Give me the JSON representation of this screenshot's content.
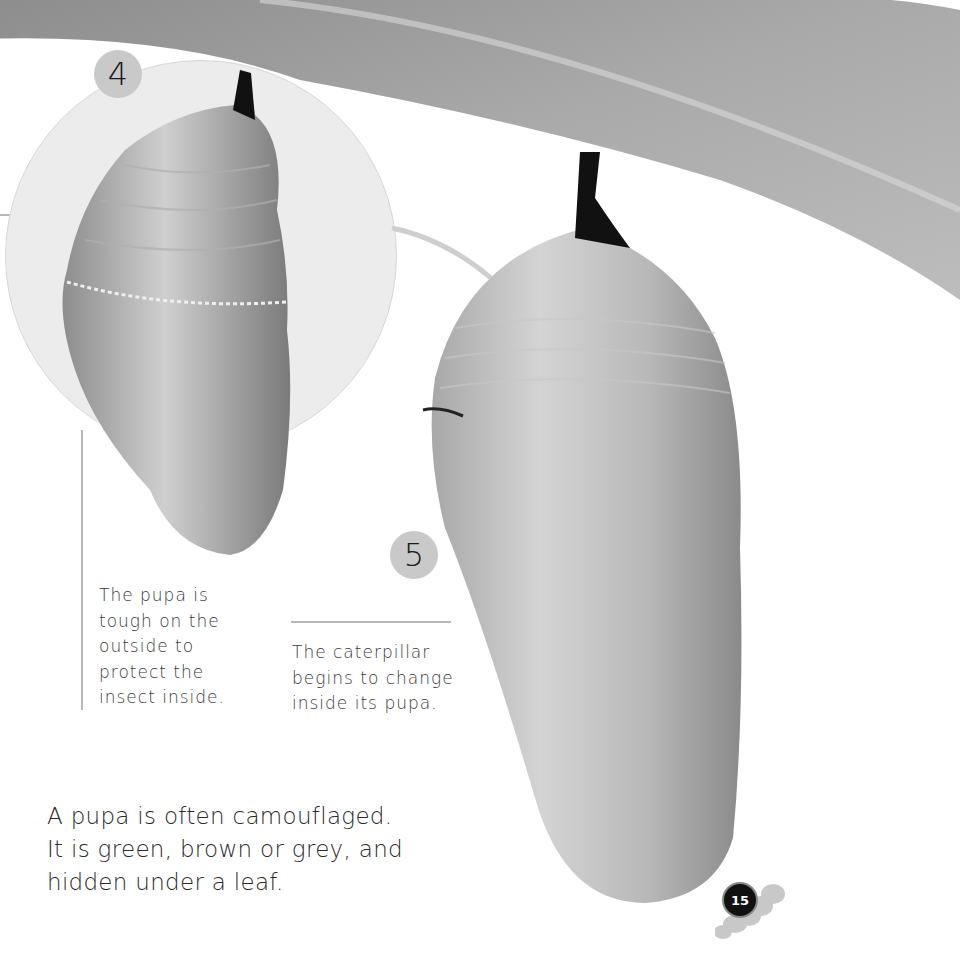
{
  "page": {
    "page_number": "15"
  },
  "steps": [
    {
      "number": "4",
      "caption_lines": [
        "The pupa is",
        "tough on the",
        "outside to",
        "protect the",
        "insect inside."
      ]
    },
    {
      "number": "5",
      "caption_lines": [
        "The caterpillar",
        "begins to change",
        "inside its pupa."
      ]
    }
  ],
  "main_text": {
    "lines": [
      "A pupa is often camouflaged.",
      "It is green, brown or grey, and",
      "hidden under a leaf."
    ]
  },
  "images": {
    "leaf": "leaf-photo",
    "pupa_small": "chrysalis-closeup-photo",
    "pupa_large": "chrysalis-hanging-photo",
    "caterpillar_icon": "caterpillar-icon"
  }
}
